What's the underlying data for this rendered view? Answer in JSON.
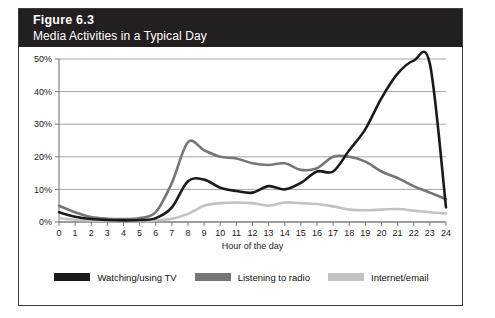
{
  "figure": {
    "number_label": "Figure 6.3",
    "subtitle": "Media Activities in a Typical Day",
    "header_bg": "#231f20"
  },
  "legend": {
    "position": "bottom-center",
    "entries": [
      {
        "label": "Watching/using TV",
        "color": "#1a1a1a"
      },
      {
        "label": "Listening to radio",
        "color": "#767676"
      },
      {
        "label": "Internet/email",
        "color": "#c2c2c2"
      }
    ]
  },
  "axes": {
    "y_ticks": [
      "0%",
      "10%",
      "20%",
      "30%",
      "40%",
      "50%"
    ],
    "x_ticks": [
      "0",
      "1",
      "2",
      "3",
      "4",
      "5",
      "6",
      "7",
      "8",
      "9",
      "10",
      "11",
      "12",
      "13",
      "14",
      "15",
      "16",
      "17",
      "18",
      "19",
      "20",
      "21",
      "22",
      "23",
      "24"
    ],
    "x_title": "Hour of the day",
    "y_title": ""
  },
  "chart_data": {
    "type": "line",
    "title": "Media Activities in a Typical Day",
    "subtitle": "Figure 6.3",
    "xlabel": "Hour of the day",
    "ylabel": "",
    "xlim": [
      0,
      24
    ],
    "ylim": [
      0,
      50
    ],
    "y_tick_values": [
      0,
      10,
      20,
      30,
      40,
      50
    ],
    "y_tick_labels": [
      "0%",
      "10%",
      "20%",
      "30%",
      "40%",
      "50%"
    ],
    "x": [
      0,
      1,
      2,
      3,
      4,
      5,
      6,
      7,
      8,
      9,
      10,
      11,
      12,
      13,
      14,
      15,
      16,
      17,
      18,
      19,
      20,
      21,
      22,
      23,
      24
    ],
    "grid": "horizontal",
    "legend_position": "bottom",
    "series": [
      {
        "name": "Watching/using TV",
        "color": "#1a1a1a",
        "values": [
          3.0,
          1.6,
          0.9,
          0.6,
          0.5,
          0.6,
          1.2,
          4.5,
          12.5,
          13.0,
          10.5,
          9.5,
          9.0,
          11.0,
          10.0,
          12.0,
          15.5,
          15.5,
          22.0,
          28.5,
          38.0,
          45.5,
          49.5,
          48.5,
          4.5
        ]
      },
      {
        "name": "Listening to radio",
        "color": "#767676",
        "values": [
          5.0,
          3.0,
          1.5,
          1.0,
          0.9,
          1.2,
          3.0,
          12.0,
          24.5,
          22.0,
          20.0,
          19.5,
          18.0,
          17.5,
          18.0,
          16.0,
          16.5,
          20.0,
          20.0,
          18.5,
          15.5,
          13.5,
          11.0,
          9.0,
          7.0
        ]
      },
      {
        "name": "Internet/email",
        "color": "#c2c2c2",
        "values": [
          1.2,
          0.7,
          0.4,
          0.3,
          0.3,
          0.3,
          0.5,
          1.0,
          2.5,
          5.0,
          5.8,
          6.0,
          5.8,
          5.0,
          6.0,
          5.8,
          5.5,
          4.8,
          3.8,
          3.6,
          3.8,
          4.0,
          3.5,
          3.0,
          2.6
        ]
      }
    ]
  }
}
